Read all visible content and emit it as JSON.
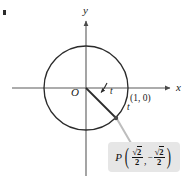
{
  "figure": {
    "type": "unit-circle-diagram",
    "axes": {
      "x_label": "x",
      "y_label": "y",
      "origin_label": "O"
    },
    "circle": {
      "center": [
        86,
        88
      ],
      "radius": 42,
      "stroke": "#2b2b2b"
    },
    "points": [
      {
        "name": "(1,0)",
        "label": "(1, 0)",
        "x": 128,
        "y": 88
      },
      {
        "name": "P",
        "label": "P",
        "x": 116,
        "y": 118
      }
    ],
    "angle": {
      "label": "t",
      "second_label": "t"
    },
    "callout": {
      "point_name": "P",
      "open_paren": "(",
      "close_paren": ")",
      "comma": ",",
      "minus": "−",
      "x_coord": {
        "numerator_radical": "√",
        "numerator_radicand": "2",
        "denominator": "2"
      },
      "y_coord": {
        "numerator_radical": "√",
        "numerator_radicand": "2",
        "denominator": "2"
      },
      "background": "#e6e6e6",
      "text": "P(√2/2, −√2/2)"
    },
    "colors": {
      "ink": "#2b2b2b",
      "axis": "#555555",
      "leader": "#b9b9b9",
      "callout_bg": "#e6e6e6"
    }
  }
}
